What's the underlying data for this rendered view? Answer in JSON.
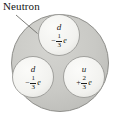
{
  "figure": {
    "title_label": "Neutron",
    "colors": {
      "outer_fill": "#c9c9c5",
      "outer_stroke": "#8f8f8b",
      "inner_fill": "#f2f2ef",
      "inner_stroke": "#9a9a96",
      "text": "#1a1a1a",
      "leader_line": "#6e6e6a",
      "background": "#ffffff"
    },
    "leader_line": {
      "name": "neutron-leader-line",
      "x1": 16,
      "y1": 15,
      "x2": 37,
      "y2": 33
    },
    "outer_circle": {
      "name": "neutron-body",
      "cx": 60,
      "cy": 63,
      "r": 49
    }
  },
  "quarks": [
    {
      "id": "top-down-quark",
      "symbol": "d",
      "flavor": "down",
      "charge_sign": "−",
      "charge_numerator": "1",
      "charge_denominator": "3",
      "charge_unit": "e",
      "charge_text": "−1/3 e",
      "cx": 59,
      "cy": 35,
      "r": 21
    },
    {
      "id": "left-down-quark",
      "symbol": "d",
      "flavor": "down",
      "charge_sign": "−",
      "charge_numerator": "1",
      "charge_denominator": "3",
      "charge_unit": "e",
      "charge_text": "−1/3 e",
      "cx": 33,
      "cy": 77,
      "r": 21
    },
    {
      "id": "right-up-quark",
      "symbol": "u",
      "flavor": "up",
      "charge_sign": "+",
      "charge_numerator": "2",
      "charge_denominator": "3",
      "charge_unit": "e",
      "charge_text": "+2/3 e",
      "cx": 84,
      "cy": 77,
      "r": 21
    }
  ]
}
